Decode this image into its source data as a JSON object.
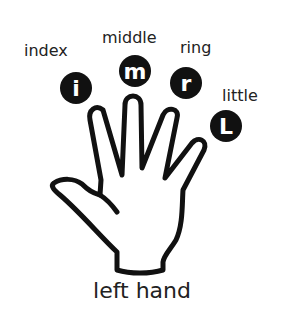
{
  "labels": {
    "index": "index",
    "middle": "middle",
    "ring": "ring",
    "little": "little"
  },
  "badges": {
    "index": "i",
    "middle": "m",
    "ring": "r",
    "little": "L"
  },
  "title": "left hand",
  "colors": {
    "ink": "#111111",
    "text": "#222222",
    "background": "#ffffff"
  }
}
